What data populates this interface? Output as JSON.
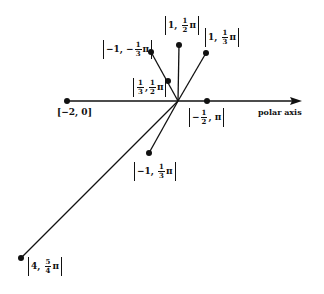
{
  "diagram": {
    "type": "polar-coordinates-plot",
    "axis_label": "polar axis",
    "origin": {
      "x": 178,
      "y": 101
    },
    "colors": {
      "ink": "#111111",
      "background": "#ffffff"
    },
    "points": [
      {
        "id": "p1",
        "label_r": "1",
        "label_theta_num": "1",
        "label_theta_den": "2",
        "label_theta_suffix": "π",
        "x": 179,
        "y": 45
      },
      {
        "id": "p2",
        "label_r": "1",
        "label_theta_num": "1",
        "label_theta_den": "3",
        "label_theta_suffix": "π",
        "x": 206,
        "y": 53
      },
      {
        "id": "p3",
        "label_r": "−1",
        "label_theta_prefix": "−",
        "label_theta_num": "1",
        "label_theta_den": "3",
        "label_theta_suffix": "π",
        "x": 151,
        "y": 52
      },
      {
        "id": "p4",
        "label_r_num": "1",
        "label_r_den": "3",
        "label_theta_num": "1",
        "label_theta_den": "2",
        "label_theta_suffix": "π",
        "x": 168,
        "y": 81
      },
      {
        "id": "p5",
        "label_r": "−2",
        "label_theta": "0",
        "x": 67,
        "y": 101
      },
      {
        "id": "p6",
        "label_r_prefix": "−",
        "label_r_num": "1",
        "label_r_den": "2",
        "label_theta": "π",
        "x": 207,
        "y": 101
      },
      {
        "id": "p7",
        "label_r": "−1",
        "label_theta_num": "1",
        "label_theta_den": "3",
        "label_theta_suffix": "π",
        "x": 149,
        "y": 153
      },
      {
        "id": "p8",
        "label_r": "4",
        "label_theta_num": "5",
        "label_theta_den": "4",
        "label_theta_suffix": "π",
        "x": 21,
        "y": 258
      }
    ]
  }
}
